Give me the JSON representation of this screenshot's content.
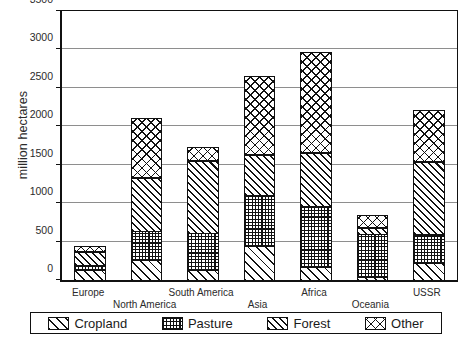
{
  "chart_data": {
    "type": "bar",
    "subtype": "stacked-bar",
    "title": "",
    "xlabel": "",
    "ylabel": "million hectares",
    "ylim": [
      0,
      3500
    ],
    "ytick_step": 500,
    "yticks": [
      0,
      500,
      1000,
      1500,
      2000,
      2500,
      3000,
      3500
    ],
    "ytick_labels": [
      "0",
      "500",
      "1000",
      "1500",
      "2000",
      "2500",
      "3000",
      "3500"
    ],
    "grid": true,
    "grid_axis": "y",
    "legend_position": "bottom",
    "units": "million hectares",
    "categories": [
      "Europe",
      "North America",
      "South America",
      "Asia",
      "Africa",
      "Oceania",
      "USSR"
    ],
    "series": [
      {
        "name": "Cropland",
        "pattern": "diagonal-hatch-wide",
        "values": [
          140,
          270,
          140,
          450,
          185,
          50,
          230
        ]
      },
      {
        "name": "Pasture",
        "pattern": "checker-dot",
        "values": [
          85,
          390,
          500,
          680,
          805,
          570,
          390
        ]
      },
      {
        "name": "Forest",
        "pattern": "diagonal-hatch-dense",
        "values": [
          175,
          700,
          950,
          540,
          700,
          100,
          960
        ]
      },
      {
        "name": "Other",
        "pattern": "cross-hatch",
        "values": [
          80,
          790,
          180,
          1030,
          1310,
          160,
          670
        ]
      }
    ],
    "cumulative_tops": {
      "Europe": [
        140,
        225,
        400,
        480
      ],
      "North America": [
        270,
        660,
        1360,
        2150
      ],
      "South America": [
        140,
        640,
        1590,
        1770
      ],
      "Asia": [
        450,
        1130,
        1670,
        2700
      ],
      "Africa": [
        185,
        990,
        1690,
        3000
      ],
      "Oceania": [
        50,
        620,
        720,
        880
      ],
      "USSR": [
        230,
        620,
        1580,
        2250
      ]
    },
    "totals": [
      480,
      2150,
      1770,
      2700,
      3000,
      880,
      2250
    ],
    "colors": {
      "ink": "#111111",
      "gridline": "#8e8e8e",
      "background": "#ffffff",
      "text": "#2b2b2b"
    }
  },
  "axis": {
    "ylabel": "million hectares"
  },
  "legend": {
    "items": [
      {
        "label": "Cropland",
        "swatch": "diagonal-hatch-wide-swatch"
      },
      {
        "label": "Pasture",
        "swatch": "checker-dot-swatch"
      },
      {
        "label": "Forest",
        "swatch": "diagonal-hatch-dense-swatch"
      },
      {
        "label": "Other",
        "swatch": "cross-hatch-swatch"
      }
    ]
  },
  "xlabels": [
    {
      "text": "Europe",
      "row": "hi"
    },
    {
      "text": "North America",
      "row": "lo"
    },
    {
      "text": "South America",
      "row": "hi"
    },
    {
      "text": "Asia",
      "row": "lo"
    },
    {
      "text": "Africa",
      "row": "hi"
    },
    {
      "text": "Oceania",
      "row": "lo"
    },
    {
      "text": "USSR",
      "row": "hi"
    }
  ]
}
